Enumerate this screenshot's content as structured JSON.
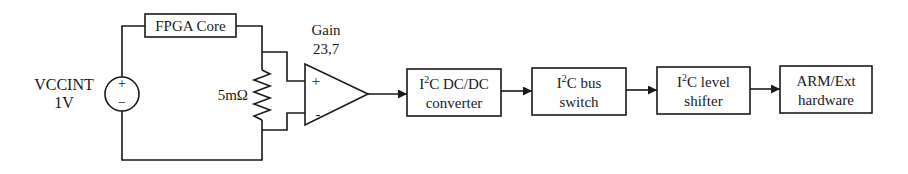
{
  "diagram": {
    "source": {
      "label_line1": "VCCINT",
      "label_line2": "1V",
      "plus": "+",
      "minus": "−"
    },
    "load": {
      "label": "FPGA Core"
    },
    "shunt": {
      "label": "5mΩ"
    },
    "amplifier": {
      "label_line1": "Gain",
      "label_line2": "23,7",
      "plus": "+",
      "minus": "-"
    },
    "blocks": [
      {
        "id": "dcdc",
        "line1_prefix": "I",
        "line1_sup": "2",
        "line1_suffix": "C DC/DC",
        "line2": "converter"
      },
      {
        "id": "busswitch",
        "line1_prefix": "I",
        "line1_sup": "2",
        "line1_suffix": "C bus",
        "line2": "switch"
      },
      {
        "id": "levelshifter",
        "line1_prefix": "I",
        "line1_sup": "2",
        "line1_suffix": "C level",
        "line2": "shifter"
      },
      {
        "id": "arm",
        "line1_prefix": "",
        "line1_sup": "",
        "line1_suffix": "ARM/Ext",
        "line2": "hardware"
      }
    ]
  }
}
